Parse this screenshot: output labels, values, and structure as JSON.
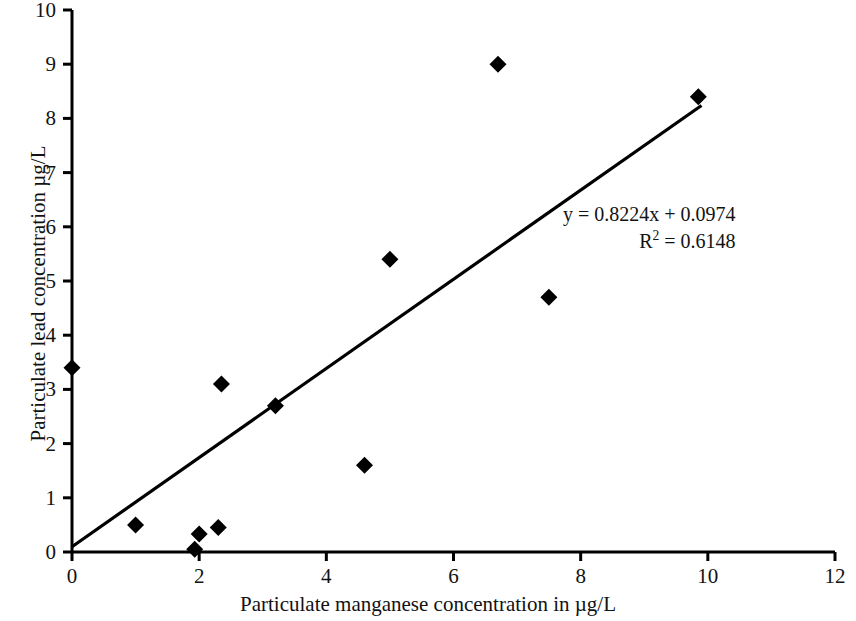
{
  "chart_data": {
    "type": "scatter",
    "title": "",
    "xlabel": "Particulate manganese concentration in µg/L",
    "ylabel": "Particulate lead concentration µg/L",
    "xlim": [
      0,
      12
    ],
    "ylim": [
      0,
      10
    ],
    "xticks": [
      0,
      2,
      4,
      6,
      8,
      10,
      12
    ],
    "yticks": [
      0,
      1,
      2,
      3,
      4,
      5,
      6,
      7,
      8,
      9,
      10
    ],
    "xtick_labels": [
      "0",
      "2",
      "4",
      "6",
      "8",
      "10",
      "12"
    ],
    "ytick_labels": [
      "0",
      "1",
      "2",
      "3",
      "4",
      "5",
      "6",
      "7",
      "8",
      "9",
      "10"
    ],
    "grid": false,
    "legend": false,
    "marker": "diamond",
    "marker_color": "#000000",
    "line_color": "#000000",
    "series": [
      {
        "name": "Particulate lead vs manganese",
        "points": [
          {
            "x": 0.0,
            "y": 3.4
          },
          {
            "x": 1.0,
            "y": 0.5
          },
          {
            "x": 1.93,
            "y": 0.05
          },
          {
            "x": 2.0,
            "y": 0.33
          },
          {
            "x": 2.3,
            "y": 0.45
          },
          {
            "x": 2.35,
            "y": 3.1
          },
          {
            "x": 3.2,
            "y": 2.7
          },
          {
            "x": 4.6,
            "y": 1.6
          },
          {
            "x": 5.0,
            "y": 5.4
          },
          {
            "x": 6.7,
            "y": 9.0
          },
          {
            "x": 7.5,
            "y": 4.7
          },
          {
            "x": 9.85,
            "y": 8.4
          }
        ]
      }
    ],
    "trendline": {
      "slope": 0.8224,
      "intercept": 0.0974,
      "r_squared": 0.6148,
      "x_start": 0.0,
      "x_end": 9.9,
      "equation_label": "y = 0.8224x + 0.0974",
      "r2_label_prefix": "R",
      "r2_label_exponent": "2",
      "r2_label_suffix": " = 0.6148"
    }
  },
  "annotations": {
    "equation": "y = 0.8224x + 0.0974",
    "r2_prefix": "R",
    "r2_exponent": "2",
    "r2_value": " = 0.6148"
  }
}
